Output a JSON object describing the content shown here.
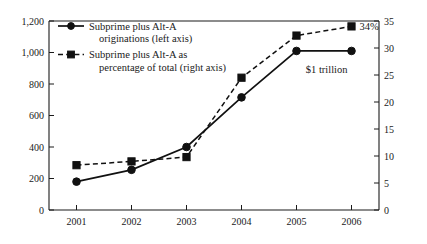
{
  "chart_data": {
    "type": "line",
    "title": "",
    "subtitle": "",
    "xlabel": "",
    "ylabel": "",
    "categories": [
      "2001",
      "2002",
      "2003",
      "2004",
      "2005",
      "2006"
    ],
    "x": [
      2001,
      2002,
      2003,
      2004,
      2005,
      2006
    ],
    "grid": false,
    "legend_position": "top-left",
    "left_axis": {
      "label": "",
      "ylim": [
        0,
        1200
      ],
      "ticks": [
        0,
        200,
        400,
        600,
        800,
        1000,
        1200
      ],
      "tick_labels": [
        "0",
        "200",
        "400",
        "600",
        "800",
        "1,000",
        "1,200"
      ]
    },
    "right_axis": {
      "label": "",
      "ylim": [
        0,
        35
      ],
      "ticks": [
        0,
        5,
        10,
        15,
        20,
        25,
        30,
        35
      ],
      "tick_labels": [
        "0",
        "5",
        "10",
        "15",
        "20",
        "25",
        "30",
        "35"
      ]
    },
    "series": [
      {
        "name": "Subprime plus Alt-A originations (left axis)",
        "axis": "left",
        "style": "solid",
        "marker": "circle",
        "values": [
          180,
          255,
          400,
          715,
          1010,
          1010
        ]
      },
      {
        "name": "Subprime plus Alt-A as percentage of total (right axis)",
        "axis": "right",
        "style": "dashed",
        "marker": "square",
        "values": [
          8.3,
          9.0,
          9.8,
          24.5,
          32.3,
          34.0
        ]
      }
    ],
    "annotations": [
      {
        "text": "34%",
        "x": 2006,
        "axis": "right",
        "value": 34.0
      },
      {
        "text": "$1 trillion",
        "x": 2006,
        "axis": "left",
        "value": 1010
      }
    ]
  },
  "legend": {
    "items": [
      {
        "label_line1": "Subprime plus Alt-A",
        "label_line2": "originations (left axis)"
      },
      {
        "label_line1": "Subprime plus Alt-A as",
        "label_line2": "percentage of total (right axis)"
      }
    ]
  },
  "colors": {
    "ink": "#111111",
    "background": "#ffffff"
  }
}
